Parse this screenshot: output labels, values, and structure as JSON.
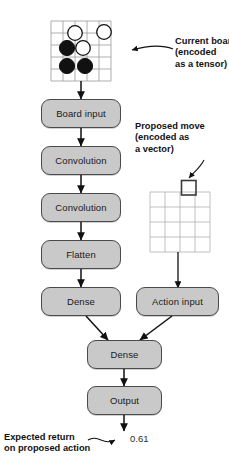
{
  "figure": {
    "background_color": "#ffffff",
    "node_fill_color": "#c9c9c9",
    "node_stroke_color": "#4a4a4a",
    "text_color": "#111111"
  },
  "pipeline": {
    "left_branch": [
      {
        "id": "board-input",
        "label": "Board input"
      },
      {
        "id": "convolution-1",
        "label": "Convolution"
      },
      {
        "id": "convolution-2",
        "label": "Convolution"
      },
      {
        "id": "flatten",
        "label": "Flatten"
      },
      {
        "id": "dense-1",
        "label": "Dense"
      }
    ],
    "right_branch": [
      {
        "id": "action-input",
        "label": "Action input"
      }
    ],
    "merged": [
      {
        "id": "dense-2",
        "label": "Dense"
      },
      {
        "id": "output",
        "label": "Output"
      }
    ]
  },
  "annotations": {
    "current_board": {
      "id": "current-board-callout",
      "lines": [
        "Current board",
        "(encoded",
        "as a tensor)"
      ],
      "text": "Current board\n(encoded\nas a tensor)"
    },
    "proposed_move": {
      "id": "proposed-move-callout",
      "lines": [
        "Proposed move",
        "(encoded as",
        "a vector)"
      ],
      "text": "Proposed move\n(encoded as\na vector)"
    },
    "expected_return": {
      "id": "expected-return-callout",
      "lines": [
        "Expected return",
        "on proposed action"
      ],
      "text": "Expected return\non proposed action"
    }
  },
  "output_value": {
    "label": "0.61",
    "value": 0.61
  },
  "board_tensor": {
    "name": "current-board",
    "grid_rows": 6,
    "grid_cols": 6,
    "stones": [
      {
        "row": 1,
        "col": 2,
        "color": "white"
      },
      {
        "row": 1,
        "col": 4,
        "color": "white"
      },
      {
        "row": 2,
        "col": 1,
        "color": "black"
      },
      {
        "row": 2,
        "col": 2,
        "color": "white"
      },
      {
        "row": 3,
        "col": 1,
        "color": "black"
      },
      {
        "row": 3,
        "col": 2,
        "color": "black"
      }
    ],
    "stone_colors": {
      "black": "#111111",
      "white": "#ffffff"
    },
    "line_color": "#9a9a9a"
  },
  "move_vector_grid": {
    "name": "proposed-move-grid",
    "grid_rows": 4,
    "grid_cols": 4,
    "highlighted_cell": {
      "row": 0,
      "col": 3
    },
    "highlight_color": "#3a3a3a",
    "line_color": "#b0b0b0"
  }
}
